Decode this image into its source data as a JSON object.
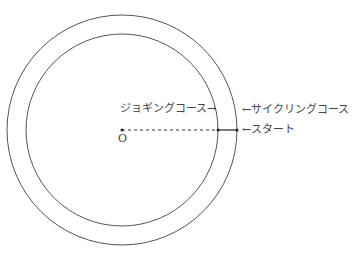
{
  "diagram": {
    "labels": {
      "jogging_course": "ジョギングコース→",
      "cycling_course": "←サイクリングコース",
      "start": "←スタート",
      "center": "O"
    },
    "colors": {
      "stroke": "#555555",
      "background": "#ffffff"
    }
  }
}
